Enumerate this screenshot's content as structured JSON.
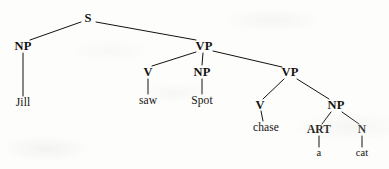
{
  "figure": {
    "type": "syntactic-parse-tree",
    "sentence": "Jill saw Spot chase a cat",
    "ink_color": "#14120f",
    "background_color": "#fdfdfc",
    "width": 389,
    "height": 169
  },
  "nodes": {
    "s": {
      "label": "S",
      "x": 88,
      "y": 18,
      "kind": "category"
    },
    "np_subject": {
      "label": "NP",
      "x": 23,
      "y": 46,
      "kind": "category"
    },
    "jill": {
      "label": "Jill",
      "x": 23,
      "y": 103,
      "kind": "word"
    },
    "vp_outer": {
      "label": "VP",
      "x": 204,
      "y": 46,
      "kind": "category"
    },
    "v_saw": {
      "label": "V",
      "x": 148,
      "y": 72,
      "kind": "category"
    },
    "saw": {
      "label": "saw",
      "x": 148,
      "y": 101,
      "kind": "word"
    },
    "np_spot": {
      "label": "NP",
      "x": 202,
      "y": 72,
      "kind": "category"
    },
    "spot": {
      "label": "Spot",
      "x": 202,
      "y": 101,
      "kind": "word"
    },
    "vp_inner": {
      "label": "VP",
      "x": 290,
      "y": 72,
      "kind": "category"
    },
    "v_chase": {
      "label": "V",
      "x": 260,
      "y": 105,
      "kind": "category"
    },
    "chase": {
      "label": "chase",
      "x": 266,
      "y": 128,
      "kind": "word"
    },
    "np_object": {
      "label": "NP",
      "x": 336,
      "y": 105,
      "kind": "category"
    },
    "art": {
      "label": "ART",
      "x": 319,
      "y": 130,
      "kind": "category"
    },
    "a": {
      "label": "a",
      "x": 319,
      "y": 153,
      "kind": "word"
    },
    "n": {
      "label": "N",
      "x": 362,
      "y": 130,
      "kind": "category"
    },
    "cat": {
      "label": "cat",
      "x": 362,
      "y": 153,
      "kind": "word"
    }
  },
  "edges": [
    {
      "from": "s",
      "to": "np_subject",
      "x1": 81,
      "y1": 22,
      "x2": 30,
      "y2": 40
    },
    {
      "from": "s",
      "to": "vp_outer",
      "x1": 96,
      "y1": 22,
      "x2": 196,
      "y2": 40
    },
    {
      "from": "np_subject",
      "to": "jill",
      "x1": 23,
      "y1": 53,
      "x2": 23,
      "y2": 96
    },
    {
      "from": "vp_outer",
      "to": "v_saw",
      "x1": 196,
      "y1": 52,
      "x2": 152,
      "y2": 66
    },
    {
      "from": "vp_outer",
      "to": "np_spot",
      "x1": 203,
      "y1": 53,
      "x2": 202,
      "y2": 65
    },
    {
      "from": "vp_outer",
      "to": "vp_inner",
      "x1": 213,
      "y1": 51,
      "x2": 282,
      "y2": 67
    },
    {
      "from": "v_saw",
      "to": "saw",
      "x1": 148,
      "y1": 79,
      "x2": 148,
      "y2": 94
    },
    {
      "from": "np_spot",
      "to": "spot",
      "x1": 202,
      "y1": 79,
      "x2": 202,
      "y2": 94
    },
    {
      "from": "vp_inner",
      "to": "v_chase",
      "x1": 284,
      "y1": 79,
      "x2": 263,
      "y2": 99
    },
    {
      "from": "vp_inner",
      "to": "np_object",
      "x1": 297,
      "y1": 79,
      "x2": 329,
      "y2": 99
    },
    {
      "from": "v_chase",
      "to": "chase",
      "x1": 261,
      "y1": 111,
      "x2": 263,
      "y2": 121
    },
    {
      "from": "np_object",
      "to": "art",
      "x1": 331,
      "y1": 112,
      "x2": 322,
      "y2": 124
    },
    {
      "from": "np_object",
      "to": "n",
      "x1": 342,
      "y1": 112,
      "x2": 359,
      "y2": 124
    },
    {
      "from": "art",
      "to": "a",
      "x1": 319,
      "y1": 136,
      "x2": 319,
      "y2": 147
    },
    {
      "from": "n",
      "to": "cat",
      "x1": 362,
      "y1": 136,
      "x2": 362,
      "y2": 147
    }
  ]
}
